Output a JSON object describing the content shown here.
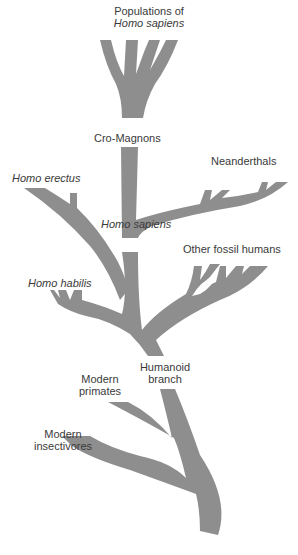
{
  "diagram": {
    "type": "evolutionary-tree",
    "fill_color": "#8e8e8e",
    "labels": {
      "populations_line1": "Populations of",
      "populations_line2": "Homo sapiens",
      "cro_magnons": "Cro-Magnons",
      "neanderthals": "Neanderthals",
      "homo_erectus": "Homo erectus",
      "homo_sapiens": "Homo sapiens",
      "other_fossil_humans": "Other fossil humans",
      "homo_habilis": "Homo habilis",
      "humanoid_line1": "Humanoid",
      "humanoid_line2": "branch",
      "primates_line1": "Modern",
      "primates_line2": "primates",
      "insectivores_line1": "Modern",
      "insectivores_line2": "insectivores"
    }
  }
}
